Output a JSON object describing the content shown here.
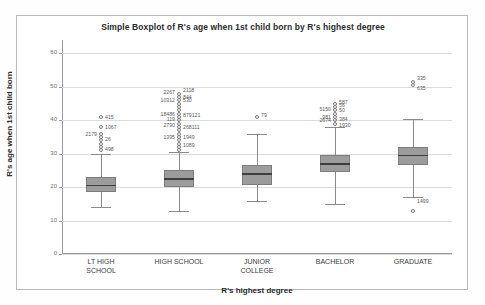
{
  "chart_data": {
    "type": "boxplot",
    "title": "Simple Boxplot of R's age when 1st child born by R's highest degree",
    "xlabel": "R's highest degree",
    "ylabel": "R's age when 1st child born",
    "ylim": [
      0,
      64
    ],
    "yticks": [
      0,
      10,
      20,
      30,
      40,
      50,
      60
    ],
    "ytick_labels": [
      "0",
      "10",
      "20",
      "30",
      "40",
      "50",
      "60"
    ],
    "grid": true,
    "legend": "none",
    "categories": [
      "LT HIGH SCHOOL",
      "HIGH SCHOOL",
      "JUNIOR COLLEGE",
      "BACHELOR",
      "GRADUATE"
    ],
    "category_lines": [
      [
        "LT HIGH",
        "SCHOOL"
      ],
      [
        "HIGH SCHOOL",
        ""
      ],
      [
        "JUNIOR",
        "COLLEGE"
      ],
      [
        "BACHELOR",
        ""
      ],
      [
        "GRADUATE",
        ""
      ]
    ],
    "boxes": [
      {
        "category": "LT HIGH SCHOOL",
        "whisker_low": 14,
        "q1": 18.5,
        "median": 20.5,
        "q3": 23,
        "whisker_high": 30,
        "outliers": [
          31,
          32,
          33,
          34,
          35,
          36,
          38,
          41
        ],
        "outlier_labels": [
          {
            "value": 41,
            "text": "415",
            "side": "right"
          },
          {
            "value": 38,
            "text": "1067",
            "side": "right"
          },
          {
            "value": 36,
            "text": "2179",
            "side": "left"
          },
          {
            "value": 34.5,
            "text": "26",
            "side": "right"
          },
          {
            "value": 31.5,
            "text": "498",
            "side": "right"
          }
        ]
      },
      {
        "category": "HIGH SCHOOL",
        "whisker_low": 13,
        "q1": 20,
        "median": 22.5,
        "q3": 25,
        "whisker_high": 30.5,
        "outliers": [
          31,
          32,
          33,
          34,
          35,
          36,
          37,
          38,
          39,
          40,
          41,
          42,
          43,
          44,
          45,
          46,
          47,
          48
        ],
        "outlier_labels": [
          {
            "value": 48.5,
            "text": "2267",
            "side": "left"
          },
          {
            "value": 49,
            "text": "2118",
            "side": "right"
          },
          {
            "value": 47,
            "text": "844",
            "side": "right"
          },
          {
            "value": 46,
            "text": "10312",
            "side": "left"
          },
          {
            "value": 46,
            "text": "530",
            "side": "right"
          },
          {
            "value": 42,
            "text": "18486",
            "side": "left"
          },
          {
            "value": 41.5,
            "text": "879121",
            "side": "right"
          },
          {
            "value": 40.5,
            "text": "119",
            "side": "left"
          },
          {
            "value": 38.5,
            "text": "2790",
            "side": "left"
          },
          {
            "value": 38,
            "text": "268111",
            "side": "right"
          },
          {
            "value": 35,
            "text": "1395",
            "side": "left"
          },
          {
            "value": 35,
            "text": "1949",
            "side": "right"
          },
          {
            "value": 32.5,
            "text": "1089",
            "side": "right"
          }
        ]
      },
      {
        "category": "JUNIOR COLLEGE",
        "whisker_low": 16,
        "q1": 20.5,
        "median": 24,
        "q3": 26.5,
        "whisker_high": 36,
        "outliers": [
          41
        ],
        "outlier_labels": [
          {
            "value": 41.5,
            "text": "79",
            "side": "right"
          }
        ]
      },
      {
        "category": "BACHELOR",
        "whisker_low": 15,
        "q1": 24.5,
        "median": 27,
        "q3": 29.5,
        "whisker_high": 38,
        "outliers": [
          39,
          40,
          41,
          42,
          43,
          44,
          45
        ],
        "outlier_labels": [
          {
            "value": 45.5,
            "text": "587",
            "side": "right"
          },
          {
            "value": 44.5,
            "text": "56",
            "side": "right"
          },
          {
            "value": 43.5,
            "text": "5150",
            "side": "left"
          },
          {
            "value": 43,
            "text": "50",
            "side": "right"
          },
          {
            "value": 41,
            "text": "981",
            "side": "left"
          },
          {
            "value": 40,
            "text": "2674",
            "side": "left"
          },
          {
            "value": 40.5,
            "text": "384",
            "side": "right"
          },
          {
            "value": 38.5,
            "text": "1930",
            "side": "right"
          }
        ]
      },
      {
        "category": "GRADUATE",
        "whisker_low": 17,
        "q1": 26.5,
        "median": 29.5,
        "q3": 32,
        "whisker_high": 40.5,
        "outliers": [
          50.5,
          51.5,
          13
        ],
        "outlier_labels": [
          {
            "value": 52.5,
            "text": "335",
            "side": "right"
          },
          {
            "value": 49.5,
            "text": "635",
            "side": "right"
          },
          {
            "value": 16,
            "text": "1499",
            "side": "right"
          }
        ]
      }
    ],
    "colors": {
      "box_fill": "#9c9c9c",
      "box_border": "#7d7d7d",
      "median": "#3d3d3d",
      "whisker": "#8a8a8a",
      "grid": "#dcdcdc",
      "axis": "#9a9a9a",
      "text": "#2b2b2b",
      "frame": "#b9b9b9"
    }
  }
}
